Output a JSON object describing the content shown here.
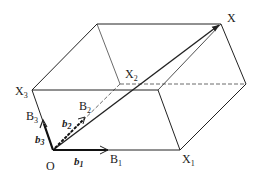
{
  "diagram": {
    "type": "parallelepiped-vector-decomposition",
    "vertices": {
      "origin": {
        "label": "O",
        "x": 53,
        "y": 150
      },
      "X1": {
        "label": "X",
        "sub": "1",
        "x": 180,
        "y": 150
      },
      "X2": {
        "label": "X",
        "sub": "2",
        "x": 120,
        "y": 84
      },
      "X3": {
        "label": "X",
        "sub": "3",
        "x": 32,
        "y": 90
      },
      "X": {
        "label": "X",
        "sub": "",
        "x": 221,
        "y": 24
      }
    },
    "basis_points": {
      "B1": {
        "label": "B",
        "sub": "1"
      },
      "B2": {
        "label": "B",
        "sub": "2"
      },
      "B3": {
        "label": "B",
        "sub": "3"
      }
    },
    "basis_vectors": {
      "b1": {
        "label": "b",
        "sub": "1"
      },
      "b2": {
        "label": "b",
        "sub": "2"
      },
      "b3": {
        "label": "b",
        "sub": "3"
      }
    },
    "line_color": "#222222",
    "background": "#ffffff"
  }
}
